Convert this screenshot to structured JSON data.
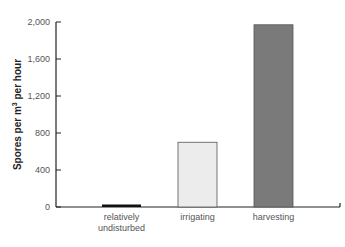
{
  "chart_data": {
    "type": "bar",
    "title": "",
    "xlabel": "",
    "ylabel": "Spores per m3 per hour",
    "ylabel_parts": {
      "pre": "Spores per m",
      "sup": "3",
      "post": " per hour"
    },
    "categories": [
      "relatively undisturbed",
      "irrigating",
      "harvesting"
    ],
    "category_lines": [
      [
        "relatively",
        "undisturbed"
      ],
      [
        "irrigating"
      ],
      [
        "harvesting"
      ]
    ],
    "values": [
      25,
      700,
      1970
    ],
    "bar_colors": [
      "#111111",
      "#ececec",
      "#7a7a7a"
    ],
    "ylim": [
      0,
      2000
    ],
    "yticks": [
      0,
      400,
      800,
      1200,
      1600,
      2000
    ],
    "ytick_labels": [
      "0",
      "400",
      "800",
      "1,200",
      "1,600",
      "2,000"
    ],
    "grid": false,
    "legend": null
  }
}
